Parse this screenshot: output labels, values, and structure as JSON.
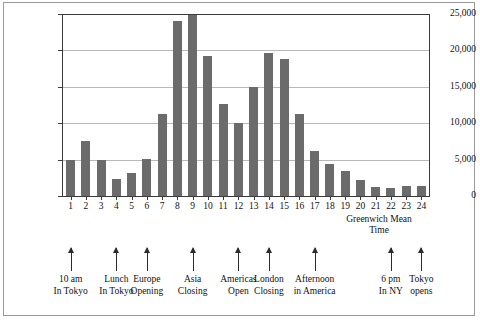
{
  "chart_data": {
    "type": "bar",
    "title": "",
    "xlabel": "Greenwich Mean Time",
    "ylabel": "",
    "categories": [
      "1",
      "2",
      "3",
      "4",
      "5",
      "6",
      "7",
      "8",
      "9",
      "10",
      "11",
      "12",
      "13",
      "14",
      "15",
      "16",
      "17",
      "18",
      "19",
      "20",
      "21",
      "22",
      "23",
      "24"
    ],
    "values": [
      5000,
      7500,
      5000,
      2300,
      3200,
      5100,
      11200,
      24000,
      25000,
      19200,
      12700,
      10000,
      15000,
      19600,
      18800,
      11200,
      6200,
      4400,
      3400,
      2200,
      1200,
      1100,
      1400,
      1400
    ],
    "ylim": [
      0,
      25000
    ],
    "ytick_labels": [
      "0",
      "5,000",
      "10,000",
      "15,000",
      "20,000",
      "25,000"
    ],
    "ytick_values": [
      0,
      5000,
      10000,
      15000,
      20000,
      25000
    ],
    "grid": true,
    "legend": false,
    "bar_color": "#6b6b6b",
    "annotations": [
      {
        "at_category": "1",
        "line1": "10 am",
        "line2": "In Tokyo"
      },
      {
        "at_category": "4",
        "line1": "Lunch",
        "line2": "In Tokyo"
      },
      {
        "at_category": "6",
        "line1": "Europe",
        "line2": "Opening"
      },
      {
        "at_category": "9",
        "line1": "Asia",
        "line2": "Closing"
      },
      {
        "at_category": "12",
        "line1": "Americas",
        "line2": "Open"
      },
      {
        "at_category": "14",
        "line1": "London",
        "line2": "Closing"
      },
      {
        "at_category": "17",
        "line1": "Afternoon",
        "line2": "in America"
      },
      {
        "at_category": "22",
        "line1": "6 pm",
        "line2": "In NY"
      },
      {
        "at_category": "24",
        "line1": "Tokyo",
        "line2": "opens"
      }
    ]
  },
  "axis_title": {
    "line1": "Greenwich Mean",
    "line2": "Time"
  }
}
